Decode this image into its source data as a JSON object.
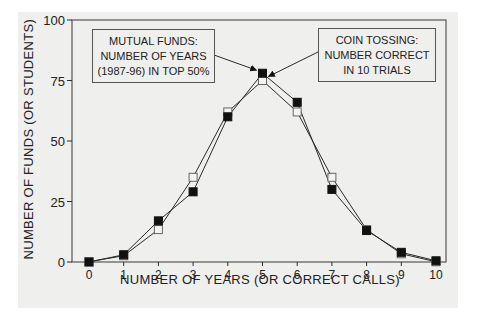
{
  "chart_data": {
    "type": "line",
    "title": "",
    "xlabel": "NUMBER OF YEARS (OR CORRECT CALLS)",
    "ylabel": "NUMBER OF FUNDS (OR STUDENTS)",
    "x": [
      0,
      1,
      2,
      3,
      4,
      5,
      6,
      7,
      8,
      9,
      10
    ],
    "x_tick_labels": [
      "0",
      "1",
      "2",
      "3",
      "4",
      "5",
      "6",
      "7",
      "8",
      "9",
      "10"
    ],
    "y_tick_labels": [
      "0",
      "25",
      "50",
      "75",
      "100"
    ],
    "ylim": [
      0,
      100
    ],
    "xlim": [
      0,
      10
    ],
    "grid": false,
    "series": [
      {
        "name": "Mutual funds: number of years (1987-96) in top 50%",
        "marker": "filled-square",
        "values": [
          0,
          3,
          17,
          29,
          60,
          78,
          66,
          30,
          13,
          4,
          0.5
        ]
      },
      {
        "name": "Coin tossing: number correct in 10 trials",
        "marker": "open-square",
        "values": [
          0.1,
          2.6,
          13.4,
          35,
          62,
          75,
          62,
          35,
          13.4,
          3.4,
          0.1
        ]
      }
    ],
    "annotations": [
      {
        "lines": [
          "MUTUAL FUNDS:",
          "NUMBER OF YEARS",
          "(1987-96) IN TOP 50%"
        ],
        "points_to": {
          "series": 0,
          "x": 5
        }
      },
      {
        "lines": [
          "COIN TOSSING:",
          "NUMBER CORRECT",
          "IN 10 TRIALS"
        ],
        "points_to": {
          "series": 1,
          "x": 5
        }
      }
    ],
    "legend": "none (callout boxes)"
  },
  "labels": {
    "ylabel": "NUMBER OF FUNDS (OR STUDENTS)",
    "xlabel": "NUMBER OF YEARS (OR CORRECT CALLS)",
    "callout_funds": [
      "MUTUAL FUNDS:",
      "NUMBER OF YEARS",
      "(1987-96) IN TOP 50%"
    ],
    "callout_coin": [
      "COIN TOSSING:",
      "NUMBER CORRECT",
      "IN 10 TRIALS"
    ]
  },
  "colors": {
    "line": "#2a2a2a",
    "background": "#efefed",
    "frame": "#555555"
  }
}
